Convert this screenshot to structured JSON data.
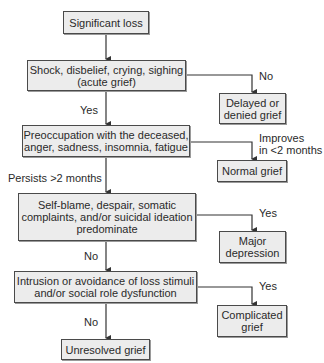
{
  "nodes": {
    "significant_loss": {
      "lines": [
        "Significant loss"
      ]
    },
    "shock": {
      "lines": [
        "Shock, disbelief, crying, sighing",
        "(acute grief)"
      ]
    },
    "delayed": {
      "lines": [
        "Delayed or",
        "denied grief"
      ]
    },
    "preoccupation": {
      "lines": [
        "Preoccupation with the deceased,",
        "anger, sadness, insomnia, fatigue"
      ]
    },
    "normal": {
      "lines": [
        "Normal grief"
      ]
    },
    "self_blame": {
      "lines": [
        "Self-blame, despair, somatic",
        "complaints, and/or suicidal ideation",
        "predominate"
      ]
    },
    "major_depression": {
      "lines": [
        "Major",
        "depression"
      ]
    },
    "intrusion": {
      "lines": [
        "Intrusion or avoidance of loss stimuli",
        "and/or social role dysfunction"
      ]
    },
    "complicated": {
      "lines": [
        "Complicated",
        "grief"
      ]
    },
    "unresolved": {
      "lines": [
        "Unresolved grief"
      ]
    }
  },
  "edges": {
    "shock_no": "No",
    "shock_yes": "Yes",
    "preoccupation_improves_1": "Improves",
    "preoccupation_improves_2": "in <2 months",
    "preoccupation_persists": "Persists >2 months",
    "self_blame_yes": "Yes",
    "self_blame_no": "No",
    "intrusion_yes": "Yes",
    "intrusion_no": "No"
  },
  "colors": {
    "box_fill": "#ececec",
    "box_border": "#4a4a4a",
    "line": "#333333"
  }
}
